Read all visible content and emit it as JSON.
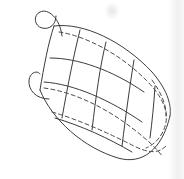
{
  "document": {
    "title": "Hand-drawn geometry sketch",
    "medium": "pencil on white paper",
    "background_color": "#ffffff",
    "stroke_color": "#3b3b41",
    "dashed_stroke_color": "#4a4a50",
    "stroke_width": 1.0,
    "canvas": {
      "width": 184,
      "height": 179
    }
  },
  "figure": {
    "name": "gridded-lens-solid",
    "outline": {
      "name": "body-outline",
      "upper_edge_path": "M 54,26 C 84,22 124,42 152,72 C 166,88 172,104 170,116",
      "lower_edge_path": "M 40,90 C 52,120 84,148 118,158 C 142,165 162,150 170,116",
      "left_vertex": {
        "x": 40,
        "y": 90
      },
      "top_vertex": {
        "x": 54,
        "y": 26
      },
      "right_tip": {
        "x": 170,
        "y": 116
      }
    },
    "hooks": [
      {
        "name": "upper-hook",
        "path": "M 62,36 C 60,18 48,8 40,12 C 33,15 34,26 42,28 C 50,30 56,24 56,16",
        "position": "upper-left"
      },
      {
        "name": "lower-hook",
        "path": "M 49,99 C 36,99 28,90 29,80 C 30,72 38,70 40,74",
        "position": "mid-left"
      }
    ],
    "grid": {
      "longitudinal_lines": [
        {
          "name": "longitude-1",
          "path": "M 54,26 C 48,44 44,66 40,90"
        },
        {
          "name": "longitude-2",
          "path": "M 80,30 C 74,54 68,84 62,118"
        },
        {
          "name": "longitude-3",
          "path": "M 106,42 C 100,66 96,96 92,130"
        },
        {
          "name": "longitude-4",
          "path": "M 134,60 C 130,84 126,114 122,146"
        },
        {
          "name": "longitude-5",
          "path": "M 155,86 C 154,104 152,122 150,138"
        }
      ],
      "latitudinal_lines": [
        {
          "name": "latitude-1",
          "path": "M 50,58 C 78,58 112,70 144,92"
        },
        {
          "name": "latitude-2",
          "path": "M 44,82 C 74,84 110,100 142,122"
        },
        {
          "name": "latitude-3",
          "path": "M 55,118 C 82,126 108,138 132,152"
        }
      ]
    },
    "hidden_contours": [
      {
        "name": "hidden-contour-top",
        "path": "M 59,32 C 86,36 120,54 146,80 C 160,94 166,106 166,116"
      },
      {
        "name": "hidden-contour-mid",
        "path": "M 44,88 C 74,92 106,108 132,128 C 148,140 158,150 162,156"
      },
      {
        "name": "hidden-contour-lower",
        "path": "M 52,112 C 80,120 110,134 134,146 C 148,153 158,154 166,146"
      },
      {
        "name": "hidden-contour-right",
        "path": "M 152,80 C 162,94 168,108 166,122 C 164,134 156,144 146,148"
      }
    ]
  },
  "annotations": {
    "labels": [],
    "caption": ""
  }
}
